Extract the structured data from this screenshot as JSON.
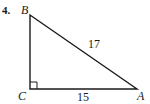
{
  "problem": {
    "number": "4.",
    "figure": "right-triangle",
    "vertices": {
      "B": {
        "label": "B",
        "x": 30,
        "y": 15
      },
      "C": {
        "label": "C",
        "x": 30,
        "y": 89
      },
      "A": {
        "label": "A",
        "x": 137,
        "y": 89
      }
    },
    "right_angle_at": "C",
    "sides": {
      "hypotenuse_AB": {
        "label": "17"
      },
      "leg_CA": {
        "label": "15"
      }
    },
    "colors": {
      "stroke": "#1a1a1a",
      "background": "#ffffff"
    }
  }
}
